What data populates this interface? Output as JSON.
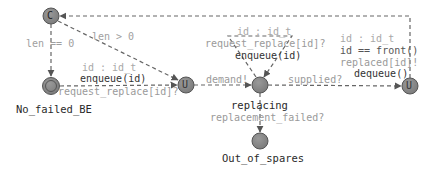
{
  "colors": {
    "node_fill": "#8a8a8a",
    "node_stroke": "#555555",
    "edge": "#666666",
    "label_grey": "#a0a0a0",
    "label_dark": "#333333"
  },
  "nodes": [
    {
      "id": "c_node",
      "kind": "committed",
      "glyph": "C",
      "x": 51,
      "y": 16
    },
    {
      "id": "no_failed_be",
      "kind": "initial",
      "glyph": "",
      "x": 51,
      "y": 86,
      "name": "No_failed_BE"
    },
    {
      "id": "u_node_1",
      "kind": "urgent",
      "glyph": "U",
      "x": 186,
      "y": 85
    },
    {
      "id": "replacing",
      "kind": "normal",
      "glyph": "",
      "x": 260,
      "y": 85,
      "name": "replacing"
    },
    {
      "id": "u_node_2",
      "kind": "urgent",
      "glyph": "U",
      "x": 410,
      "y": 86
    },
    {
      "id": "out_of_spares",
      "kind": "normal",
      "glyph": "",
      "x": 260,
      "y": 141,
      "name": "Out_of_spares"
    }
  ],
  "labels": {
    "c_node_glyph": "C",
    "u1_glyph": "U",
    "u2_glyph": "U",
    "no_failed_be": "No_failed_BE",
    "replacing": "replacing",
    "out_of_spares": "Out_of_spares",
    "len_eq_0": "len == 0",
    "len_gt_0": "len > 0",
    "edge1_select": "id : id_t",
    "edge1_update": "enqueue(id)",
    "edge1_sync": "request_replace[id]?",
    "demand": "demand!",
    "self_select": "id : id_t",
    "self_sync": "request_replace[id]?",
    "self_update": "enqueue(id)",
    "supplied": "supplied?",
    "edge4_select": "id : id_t",
    "edge4_guard": "id == front()",
    "edge4_sync": "replaced[id]!",
    "edge4_update": "dequeue()",
    "replacement_failed": "replacement_failed?"
  }
}
